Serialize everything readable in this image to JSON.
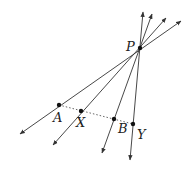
{
  "diagram": {
    "colors": {
      "line": "#333333",
      "point": "#111111",
      "dotted": "#555555",
      "background": "#ffffff"
    },
    "points": {
      "P": {
        "label": "P",
        "x": 140,
        "y": 48
      },
      "A": {
        "label": "A",
        "x": 59,
        "y": 105
      },
      "X": {
        "label": "X",
        "x": 81,
        "y": 111
      },
      "B": {
        "label": "B",
        "x": 114,
        "y": 119
      },
      "Y": {
        "label": "Y",
        "x": 133,
        "y": 124
      }
    },
    "rays": [
      {
        "name": "line-PA",
        "top": [
          181,
          21
        ],
        "bottom": [
          20,
          134
        ]
      },
      {
        "name": "line-PX",
        "top": [
          166,
          18
        ],
        "bottom": [
          53,
          145
        ]
      },
      {
        "name": "line-PB",
        "top": [
          152,
          14
        ],
        "bottom": [
          102,
          153
        ]
      },
      {
        "name": "line-PY",
        "top": [
          143,
          12
        ],
        "bottom": [
          130,
          160
        ]
      }
    ],
    "dotted_segment": {
      "from": "A",
      "to": "Y"
    }
  }
}
